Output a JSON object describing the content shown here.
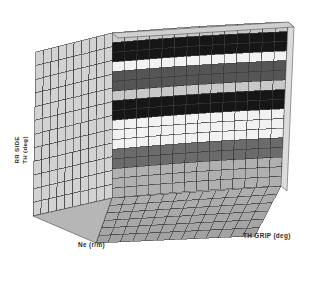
{
  "figure": {
    "background": "#ffffff",
    "type": "3d-surface-plot"
  },
  "axes": {
    "z_label_line1": "RR SIDE",
    "z_label_line2": "TH (deg)",
    "x_label": "Ne (r/m)",
    "y_label": "TH GRIP (deg)"
  },
  "chart_data": {
    "type": "heatmap",
    "render": "3d-surface-mesh",
    "title": "",
    "xlabel": "Ne (r/m)",
    "ylabel": "TH GRIP (deg)",
    "zlabel": "RR SIDE TH (deg)",
    "grid": true,
    "legend": null,
    "nx": 14,
    "ny": 13,
    "palette": [
      "#161616",
      "#555555",
      "#8d8d8d",
      "#c8c8c8",
      "#f2f2f2"
    ],
    "band_colors_top_to_bottom": [
      "#c8c8c8",
      "#161616",
      "#f2f2f2",
      "#555555",
      "#c8c8c8",
      "#161616",
      "#f2f2f2",
      "#6b6b6b",
      "#b0b0b0"
    ],
    "band_rows_top_to_bottom": [
      1,
      2,
      1,
      2,
      1,
      2,
      3,
      2,
      3
    ],
    "wall_left_color": "#d2d2d2",
    "floor_color": "#aeaeae",
    "mesh_line_color": "#3a3a3a",
    "z_rows": [
      [
        4,
        4,
        4,
        4,
        4,
        4,
        4,
        4,
        4,
        4,
        4,
        4,
        4,
        4
      ],
      [
        0,
        0,
        0,
        0,
        0,
        0,
        0,
        0,
        0,
        0,
        0,
        0,
        0,
        0
      ],
      [
        0,
        0,
        0,
        0,
        0,
        0,
        0,
        0,
        0,
        0,
        0,
        0,
        0,
        0
      ],
      [
        5,
        5,
        5,
        5,
        5,
        5,
        5,
        5,
        5,
        5,
        5,
        5,
        5,
        5
      ],
      [
        2,
        2,
        2,
        2,
        2,
        2,
        2,
        2,
        2,
        2,
        2,
        2,
        2,
        2
      ],
      [
        2,
        2,
        2,
        2,
        2,
        2,
        2,
        2,
        2,
        2,
        2,
        2,
        2,
        2
      ],
      [
        4,
        4,
        4,
        4,
        4,
        4,
        4,
        4,
        4,
        4,
        4,
        4,
        4,
        4
      ],
      [
        0,
        0,
        0,
        0,
        0,
        0,
        0,
        0,
        0,
        0,
        0,
        0,
        0,
        0
      ],
      [
        0,
        0,
        0,
        0,
        0,
        0,
        0,
        0,
        0,
        0,
        0,
        0,
        0,
        0
      ],
      [
        5,
        5,
        5,
        5,
        5,
        5,
        5,
        5,
        5,
        5,
        5,
        5,
        5,
        5
      ],
      [
        5,
        5,
        5,
        5,
        5,
        5,
        5,
        5,
        5,
        5,
        5,
        5,
        5,
        5
      ],
      [
        5,
        5,
        5,
        5,
        5,
        5,
        5,
        5,
        5,
        5,
        5,
        5,
        5,
        5
      ],
      [
        2,
        2,
        2,
        2,
        2,
        2,
        2,
        2,
        2,
        2,
        2,
        2,
        2,
        2
      ]
    ]
  }
}
